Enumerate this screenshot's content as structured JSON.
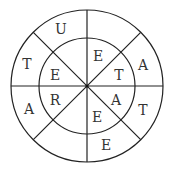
{
  "puzzle": {
    "type": "letter-wheel",
    "rings": [
      "inner",
      "outer"
    ],
    "sectors": [
      {
        "index": 0,
        "inner": "E",
        "outer": ""
      },
      {
        "index": 1,
        "inner": "T",
        "outer": "A"
      },
      {
        "index": 2,
        "inner": "A",
        "outer": "T"
      },
      {
        "index": 3,
        "inner": "E",
        "outer": "E"
      },
      {
        "index": 4,
        "inner": "",
        "outer": ""
      },
      {
        "index": 5,
        "inner": "R",
        "outer": "A"
      },
      {
        "index": 6,
        "inner": "E",
        "outer": "T"
      },
      {
        "index": 7,
        "inner": "",
        "outer": "U"
      }
    ],
    "letters": {
      "s0_inner": "E",
      "s1_inner": "T",
      "s1_outer": "A",
      "s2_inner": "A",
      "s2_outer": "T",
      "s3_inner": "E",
      "s3_outer": "E",
      "s5_inner": "R",
      "s5_outer": "A",
      "s6_inner": "E",
      "s6_outer": "T",
      "s7_outer": "U"
    }
  },
  "colors": {
    "line": "#222222",
    "text": "#333333",
    "background": "#ffffff"
  }
}
